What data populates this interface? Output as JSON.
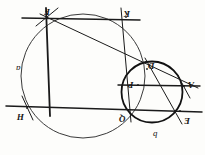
{
  "figure": {
    "caption": "",
    "orientation": "rotated-180",
    "ink_color": "#1a1a1a",
    "background_color": "#fdfdfb",
    "points": [
      {
        "id": "F",
        "label": "F",
        "x": 47,
        "y": 14,
        "lx": 44,
        "ly": 7
      },
      {
        "id": "K",
        "label": "K",
        "x": 126,
        "y": 17,
        "lx": 124,
        "ly": 9
      },
      {
        "id": "D",
        "label": "D",
        "x": 147,
        "y": 69,
        "lx": 148,
        "ly": 61
      },
      {
        "id": "P",
        "label": "P",
        "x": 138,
        "y": 85,
        "lx": 128,
        "ly": 80
      },
      {
        "id": "A",
        "label": "A",
        "x": 184,
        "y": 86,
        "lx": 188,
        "ly": 80
      },
      {
        "id": "H",
        "label": "H",
        "x": 27,
        "y": 108,
        "lx": 17,
        "ly": 112
      },
      {
        "id": "Q",
        "label": "Q",
        "x": 128,
        "y": 110,
        "lx": 119,
        "ly": 114
      },
      {
        "id": "E",
        "label": "E",
        "x": 180,
        "y": 111,
        "lx": 184,
        "ly": 116
      }
    ],
    "curve_labels": [
      {
        "id": "big-circle-label",
        "label": "a",
        "lx": 16,
        "ly": 64
      },
      {
        "id": "small-circle-label",
        "label": "b",
        "lx": 153,
        "ly": 130
      }
    ],
    "circles": [
      {
        "id": "large-circle",
        "cx": 83,
        "cy": 76,
        "r": 62,
        "stroke": "#3a3a3a",
        "width": 1.0
      },
      {
        "id": "small-circle",
        "cx": 152,
        "cy": 92,
        "r": 30.5,
        "stroke": "#111111",
        "width": 1.8
      }
    ],
    "lines": [
      {
        "id": "line-FK",
        "x1": 22,
        "y1": 18,
        "x2": 140,
        "y2": 20,
        "width": 1.5
      },
      {
        "id": "line-FA",
        "x1": 40,
        "y1": 14,
        "x2": 198,
        "y2": 88,
        "width": 1.0
      },
      {
        "id": "line-FQ",
        "x1": 46,
        "y1": 8,
        "x2": 50,
        "y2": 116,
        "width": 1.8
      },
      {
        "id": "line-HE",
        "x1": 6,
        "y1": 106,
        "x2": 202,
        "y2": 112,
        "width": 1.5
      },
      {
        "id": "line-PA",
        "x1": 118,
        "y1": 85,
        "x2": 200,
        "y2": 86,
        "width": 1.4
      },
      {
        "id": "line-KQ",
        "x1": 121,
        "y1": 8,
        "x2": 131,
        "y2": 122,
        "width": 1.0
      },
      {
        "id": "line-DE",
        "x1": 145,
        "y1": 58,
        "x2": 182,
        "y2": 124,
        "width": 1.0
      },
      {
        "id": "tick-F",
        "x1": 36,
        "y1": 26,
        "x2": 58,
        "y2": 8,
        "width": 1.0
      },
      {
        "id": "tick-A",
        "x1": 177,
        "y1": 74,
        "x2": 190,
        "y2": 98,
        "width": 1.0
      },
      {
        "id": "tick-H",
        "x1": 22,
        "y1": 96,
        "x2": 33,
        "y2": 120,
        "width": 1.0
      }
    ]
  }
}
